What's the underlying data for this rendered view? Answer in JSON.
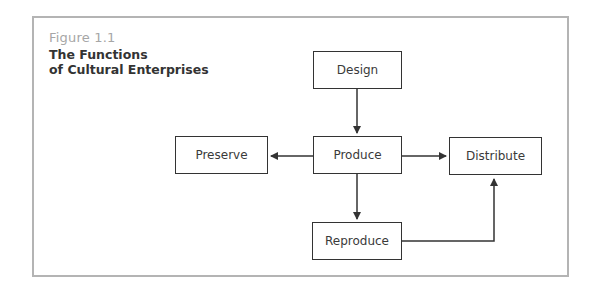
{
  "figure": {
    "label": "Figure 1.1",
    "title_line1": "The Functions",
    "title_line2": "of Cultural Enterprises"
  },
  "nodes": {
    "design": "Design",
    "preserve": "Preserve",
    "produce": "Produce",
    "distribute": "Distribute",
    "reproduce": "Reproduce"
  },
  "edges": [
    {
      "from": "Design",
      "to": "Produce"
    },
    {
      "from": "Produce",
      "to": "Preserve"
    },
    {
      "from": "Produce",
      "to": "Distribute"
    },
    {
      "from": "Produce",
      "to": "Reproduce"
    },
    {
      "from": "Reproduce",
      "to": "Distribute"
    }
  ],
  "colors": {
    "frame": "#b4b4b4",
    "label": "#a6a6a6",
    "line": "#333333"
  }
}
